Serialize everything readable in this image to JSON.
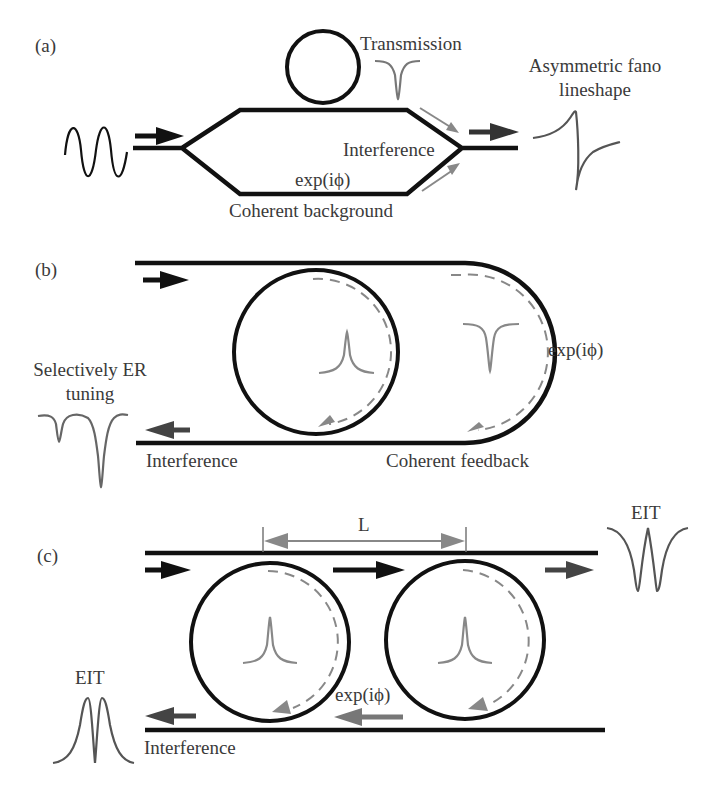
{
  "figure": {
    "panels": [
      {
        "id": "a",
        "label": "(a)",
        "texts": {
          "transmission": "Transmission",
          "fano_line1": "Asymmetric fano",
          "fano_line2": "lineshape",
          "interference": "Interference",
          "phase": "exp(iϕ)",
          "background": "Coherent background"
        },
        "curves": [
          "input-sine-wave",
          "transmission-dip",
          "fano-lineshape"
        ]
      },
      {
        "id": "b",
        "label": "(b)",
        "texts": {
          "er_line1": "Selectively ER",
          "er_line2": "tuning",
          "phase": "exp(iϕ)",
          "interference": "Interference",
          "feedback": "Coherent feedback"
        },
        "curves": [
          "resonance-peak",
          "transmission-dip",
          "double-dip-er-tuning"
        ]
      },
      {
        "id": "c",
        "label": "(c)",
        "texts": {
          "distance": "L",
          "eit_top": "EIT",
          "eit_bottom": "EIT",
          "phase": "exp(iϕ)",
          "interference": "Interference"
        },
        "curves": [
          "resonance-peak-ring1",
          "resonance-peak-ring2",
          "eit-transmission",
          "eit-reflection"
        ]
      }
    ],
    "colors": {
      "waveguide": "#111111",
      "signal": "#777777",
      "arrow_dark": "#1a1a1a",
      "arrow_mid": "#444444",
      "arrow_light": "#808080",
      "text": "#3a3a3a"
    }
  }
}
